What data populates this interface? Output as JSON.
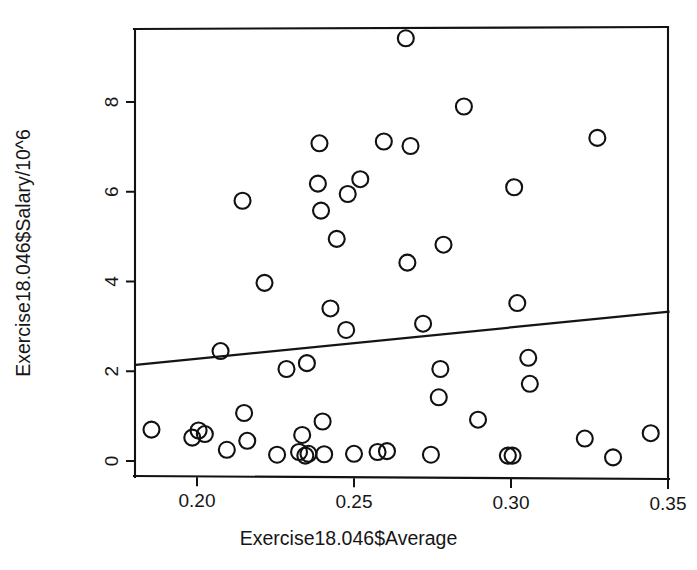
{
  "chart_data": {
    "type": "scatter",
    "title": "",
    "subtitle": "",
    "xlabel": "Exercise18.046$Average",
    "ylabel": "Exercise18.046$Salary/10^6",
    "xlim": [
      0.1805,
      0.3505
    ],
    "ylim": [
      -0.22,
      9.82
    ],
    "xticks": [
      0.2,
      0.25,
      0.3,
      0.35
    ],
    "xtick_labels": [
      "0.20",
      "0.25",
      "0.30",
      "0.35"
    ],
    "yticks": [
      0,
      2,
      4,
      6,
      8
    ],
    "ytick_labels": [
      "0",
      "2",
      "4",
      "6",
      "8"
    ],
    "grid": false,
    "legend": null,
    "marker": "open-circle",
    "marker_radius_px": 8,
    "point_count": 62,
    "points": [
      [
        0.1855,
        0.7
      ],
      [
        0.1985,
        0.52
      ],
      [
        0.2005,
        0.68
      ],
      [
        0.2025,
        0.6
      ],
      [
        0.2075,
        2.45
      ],
      [
        0.2095,
        0.25
      ],
      [
        0.2145,
        5.8
      ],
      [
        0.215,
        1.07
      ],
      [
        0.216,
        0.45
      ],
      [
        0.2215,
        3.97
      ],
      [
        0.2255,
        0.14
      ],
      [
        0.2285,
        2.05
      ],
      [
        0.2325,
        0.2
      ],
      [
        0.2335,
        0.58
      ],
      [
        0.2345,
        0.12
      ],
      [
        0.235,
        2.18
      ],
      [
        0.2355,
        0.16
      ],
      [
        0.2385,
        6.18
      ],
      [
        0.239,
        7.08
      ],
      [
        0.2395,
        5.58
      ],
      [
        0.24,
        0.88
      ],
      [
        0.2405,
        0.15
      ],
      [
        0.2425,
        3.4
      ],
      [
        0.2445,
        4.95
      ],
      [
        0.2475,
        2.92
      ],
      [
        0.248,
        5.95
      ],
      [
        0.25,
        0.16
      ],
      [
        0.252,
        6.28
      ],
      [
        0.2575,
        0.2
      ],
      [
        0.2595,
        7.12
      ],
      [
        0.2605,
        0.22
      ],
      [
        0.2665,
        9.42
      ],
      [
        0.267,
        4.42
      ],
      [
        0.268,
        7.02
      ],
      [
        0.272,
        3.06
      ],
      [
        0.2745,
        0.14
      ],
      [
        0.277,
        1.42
      ],
      [
        0.2775,
        2.05
      ],
      [
        0.2785,
        4.82
      ],
      [
        0.285,
        7.9
      ],
      [
        0.2895,
        0.92
      ],
      [
        0.299,
        0.12
      ],
      [
        0.3005,
        0.12
      ],
      [
        0.301,
        6.1
      ],
      [
        0.302,
        3.52
      ],
      [
        0.3055,
        2.3
      ],
      [
        0.306,
        1.72
      ],
      [
        0.3235,
        0.5
      ],
      [
        0.3275,
        7.2
      ],
      [
        0.3325,
        0.08
      ],
      [
        0.3445,
        0.62
      ]
    ],
    "fit_line": {
      "label": "least-squares regression line",
      "x_start": 0.1805,
      "y_start": 2.14,
      "x_end": 0.3505,
      "y_end": 3.33,
      "slope": 7.0,
      "intercept": 0.875
    }
  },
  "geometry": {
    "plot_left_px": 135,
    "plot_right_px": 668,
    "plot_top_px": 28,
    "plot_bottom_px": 478,
    "x_at_020_px": 197,
    "x_at_035_px": 668,
    "y_at_0_px": 461,
    "y_at_8_px": 102
  }
}
